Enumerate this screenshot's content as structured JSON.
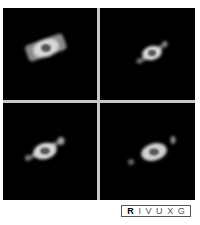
{
  "figure": {
    "panels": [
      {
        "id": "panel-1",
        "label": "nebula image panel 1"
      },
      {
        "id": "panel-2",
        "label": "nebula image panel 2"
      },
      {
        "id": "panel-3",
        "label": "nebula image panel 3"
      },
      {
        "id": "panel-4",
        "label": "nebula image panel 4"
      }
    ],
    "colors": {
      "background": "#000000",
      "divider": "#c8c8c8",
      "glow": "#e8e8e8"
    }
  },
  "filter_bar": {
    "items": [
      {
        "label": "R",
        "active": true
      },
      {
        "label": "I",
        "active": false
      },
      {
        "label": "V",
        "active": false
      },
      {
        "label": "U",
        "active": false
      },
      {
        "label": "X",
        "active": false
      },
      {
        "label": "G",
        "active": false
      }
    ]
  }
}
